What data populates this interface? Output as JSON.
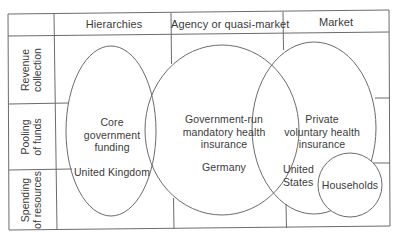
{
  "headers": {
    "columns": [
      "Hierarchies",
      "Agency or quasi-market",
      "Market"
    ]
  },
  "rows": {
    "labels": [
      {
        "line1": "Revenue",
        "line2": "collection"
      },
      {
        "line1": "Pooling",
        "line2": "of funds"
      },
      {
        "line1": "Spending",
        "line2": "of resources"
      }
    ]
  },
  "ellipses": {
    "hierarchies": {
      "line1": "Core",
      "line2": "government",
      "line3": "funding",
      "example": "United Kingdom"
    },
    "agency": {
      "line1": "Government-run",
      "line2": "mandatory health",
      "line3": "insurance",
      "example": "Germany"
    },
    "market": {
      "line1": "Private",
      "line2": "voluntary health",
      "line3": "insurance",
      "example_line1": "United",
      "example_line2": "States"
    },
    "households": {
      "label": "Households"
    }
  },
  "colors": {
    "line": "#6b6b6b",
    "text": "#3a3a3a",
    "background": "#ffffff"
  }
}
